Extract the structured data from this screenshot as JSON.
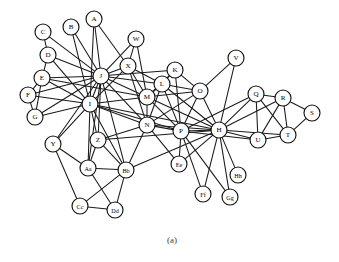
{
  "figure": {
    "caption": "(a)",
    "caption_x": 172,
    "caption_y": 243,
    "width": 339,
    "height": 262,
    "background_color": "#ffffff"
  },
  "chart_data": {
    "type": "diagram",
    "diagram_kind": "node-link-graph",
    "title": "",
    "xlabel": "",
    "ylabel": "",
    "node_radius": 8,
    "node_fill": "#ffffff",
    "node_stroke": "#111111",
    "edge_color": "#1a1a1a",
    "node_count": 34,
    "edge_count": 100,
    "nodes": [
      {
        "id": "A",
        "label": "A",
        "x": 94,
        "y": 19
      },
      {
        "id": "B",
        "label": "B",
        "x": 71,
        "y": 27
      },
      {
        "id": "C",
        "label": "C",
        "x": 43,
        "y": 32
      },
      {
        "id": "D",
        "label": "D",
        "x": 48,
        "y": 55
      },
      {
        "id": "E",
        "label": "E",
        "x": 42,
        "y": 78
      },
      {
        "id": "F",
        "label": "F",
        "x": 28,
        "y": 95
      },
      {
        "id": "G",
        "label": "G",
        "x": 35,
        "y": 117
      },
      {
        "id": "H",
        "label": "H",
        "x": 219,
        "y": 130
      },
      {
        "id": "I",
        "label": "I",
        "x": 90,
        "y": 104
      },
      {
        "id": "J",
        "label": "J",
        "x": 101,
        "y": 76
      },
      {
        "id": "K",
        "label": "K",
        "x": 175,
        "y": 70
      },
      {
        "id": "L",
        "label": "L",
        "x": 162,
        "y": 84
      },
      {
        "id": "M",
        "label": "M",
        "x": 147,
        "y": 97
      },
      {
        "id": "N",
        "label": "N",
        "x": 147,
        "y": 125
      },
      {
        "id": "O",
        "label": "O",
        "x": 200,
        "y": 91
      },
      {
        "id": "P",
        "label": "P",
        "x": 181,
        "y": 131
      },
      {
        "id": "Q",
        "label": "Q",
        "x": 256,
        "y": 94
      },
      {
        "id": "R",
        "label": "R",
        "x": 283,
        "y": 98
      },
      {
        "id": "S",
        "label": "S",
        "x": 312,
        "y": 113
      },
      {
        "id": "T",
        "label": "T",
        "x": 288,
        "y": 135
      },
      {
        "id": "U",
        "label": "U",
        "x": 258,
        "y": 140
      },
      {
        "id": "V",
        "label": "V",
        "x": 236,
        "y": 58
      },
      {
        "id": "W",
        "label": "W",
        "x": 136,
        "y": 39
      },
      {
        "id": "X",
        "label": "X",
        "x": 128,
        "y": 66
      },
      {
        "id": "Y",
        "label": "Y",
        "x": 53,
        "y": 144
      },
      {
        "id": "Z",
        "label": "Z",
        "x": 98,
        "y": 140
      },
      {
        "id": "Aa",
        "label": "Aa",
        "x": 88,
        "y": 168
      },
      {
        "id": "Bb",
        "label": "Bb",
        "x": 126,
        "y": 170
      },
      {
        "id": "Cc",
        "label": "Cc",
        "x": 80,
        "y": 206
      },
      {
        "id": "Dd",
        "label": "Dd",
        "x": 115,
        "y": 210
      },
      {
        "id": "Ee",
        "label": "Ee",
        "x": 179,
        "y": 164
      },
      {
        "id": "Ff",
        "label": "Ff",
        "x": 203,
        "y": 194
      },
      {
        "id": "Gg",
        "label": "Gg",
        "x": 230,
        "y": 197
      },
      {
        "id": "Hh",
        "label": "Hh",
        "x": 238,
        "y": 175
      }
    ],
    "edges": [
      [
        "A",
        "J"
      ],
      [
        "A",
        "I"
      ],
      [
        "A",
        "X"
      ],
      [
        "B",
        "J"
      ],
      [
        "B",
        "I"
      ],
      [
        "C",
        "D"
      ],
      [
        "C",
        "J"
      ],
      [
        "D",
        "E"
      ],
      [
        "D",
        "J"
      ],
      [
        "D",
        "I"
      ],
      [
        "E",
        "F"
      ],
      [
        "E",
        "J"
      ],
      [
        "E",
        "I"
      ],
      [
        "E",
        "G"
      ],
      [
        "E",
        "M"
      ],
      [
        "F",
        "J"
      ],
      [
        "F",
        "I"
      ],
      [
        "F",
        "G"
      ],
      [
        "G",
        "I"
      ],
      [
        "G",
        "J"
      ],
      [
        "J",
        "I"
      ],
      [
        "J",
        "X"
      ],
      [
        "J",
        "W"
      ],
      [
        "J",
        "M"
      ],
      [
        "J",
        "N"
      ],
      [
        "J",
        "Y"
      ],
      [
        "J",
        "Z"
      ],
      [
        "J",
        "Aa"
      ],
      [
        "J",
        "Bb"
      ],
      [
        "J",
        "K"
      ],
      [
        "J",
        "L"
      ],
      [
        "I",
        "Y"
      ],
      [
        "I",
        "Z"
      ],
      [
        "I",
        "Aa"
      ],
      [
        "I",
        "Bb"
      ],
      [
        "I",
        "N"
      ],
      [
        "I",
        "M"
      ],
      [
        "I",
        "X"
      ],
      [
        "I",
        "P"
      ],
      [
        "I",
        "H"
      ],
      [
        "W",
        "X"
      ],
      [
        "W",
        "M"
      ],
      [
        "X",
        "M"
      ],
      [
        "X",
        "N"
      ],
      [
        "X",
        "L"
      ],
      [
        "K",
        "L"
      ],
      [
        "K",
        "O"
      ],
      [
        "K",
        "P"
      ],
      [
        "K",
        "M"
      ],
      [
        "L",
        "M"
      ],
      [
        "L",
        "N"
      ],
      [
        "L",
        "O"
      ],
      [
        "L",
        "P"
      ],
      [
        "L",
        "H"
      ],
      [
        "M",
        "N"
      ],
      [
        "M",
        "P"
      ],
      [
        "M",
        "O"
      ],
      [
        "M",
        "H"
      ],
      [
        "N",
        "P"
      ],
      [
        "N",
        "Z"
      ],
      [
        "N",
        "Bb"
      ],
      [
        "N",
        "Ee"
      ],
      [
        "N",
        "H"
      ],
      [
        "N",
        "O"
      ],
      [
        "O",
        "P"
      ],
      [
        "O",
        "H"
      ],
      [
        "O",
        "V"
      ],
      [
        "P",
        "H"
      ],
      [
        "P",
        "Ee"
      ],
      [
        "P",
        "Ff"
      ],
      [
        "P",
        "U"
      ],
      [
        "P",
        "Q"
      ],
      [
        "P",
        "Gg"
      ],
      [
        "H",
        "Q"
      ],
      [
        "H",
        "R"
      ],
      [
        "H",
        "T"
      ],
      [
        "H",
        "U"
      ],
      [
        "H",
        "V"
      ],
      [
        "H",
        "Ee"
      ],
      [
        "H",
        "Ff"
      ],
      [
        "H",
        "Gg"
      ],
      [
        "H",
        "Hh"
      ],
      [
        "H",
        "Bb"
      ],
      [
        "H",
        "Z"
      ],
      [
        "Q",
        "R"
      ],
      [
        "Q",
        "U"
      ],
      [
        "Q",
        "T"
      ],
      [
        "R",
        "S"
      ],
      [
        "R",
        "T"
      ],
      [
        "R",
        "U"
      ],
      [
        "S",
        "T"
      ],
      [
        "T",
        "U"
      ],
      [
        "Y",
        "Aa"
      ],
      [
        "Y",
        "Cc"
      ],
      [
        "Z",
        "Aa"
      ],
      [
        "Z",
        "Bb"
      ],
      [
        "Aa",
        "Bb"
      ],
      [
        "Aa",
        "Dd"
      ],
      [
        "Bb",
        "Cc"
      ],
      [
        "Bb",
        "Dd"
      ],
      [
        "Cc",
        "Dd"
      ]
    ]
  }
}
